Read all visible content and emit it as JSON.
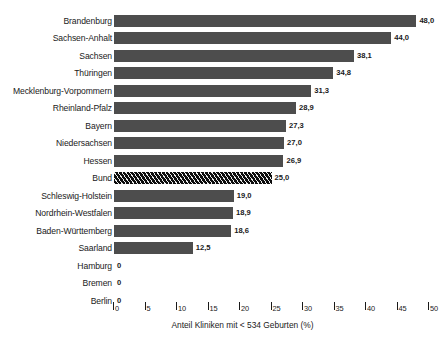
{
  "chart_data": {
    "type": "bar",
    "orientation": "horizontal",
    "title": "",
    "xlabel": "Anteil Kliniken mit < 534 Geburten (%)",
    "ylabel": "",
    "xlim": [
      0,
      50
    ],
    "xticks": [
      0,
      5,
      10,
      15,
      20,
      25,
      30,
      35,
      40,
      45,
      50
    ],
    "xtick_labels": [
      "0",
      "5",
      "10",
      "15",
      "20",
      "25",
      "30",
      "35",
      "40",
      "45",
      "50"
    ],
    "grid": false,
    "legend": "none",
    "decimal_separator": ",",
    "categories": [
      "Brandenburg",
      "Sachsen-Anhalt",
      "Sachsen",
      "Thüringen",
      "Mecklenburg-Vorpommern",
      "Rheinland-Pfalz",
      "Bayern",
      "Niedersachsen",
      "Hessen",
      "Bund",
      "Schleswig-Holstein",
      "Nordrhein-Westfalen",
      "Baden-Württemberg",
      "Saarland",
      "Hamburg",
      "Bremen",
      "Berlin"
    ],
    "values": [
      48.0,
      44.0,
      38.1,
      34.8,
      31.3,
      28.9,
      27.3,
      27.0,
      26.9,
      25.0,
      19.0,
      18.9,
      18.6,
      12.5,
      0,
      0,
      0
    ],
    "value_labels": [
      "48,0",
      "44,0",
      "38,1",
      "34,8",
      "31,3",
      "28,9",
      "27,3",
      "27,0",
      "26,9",
      "25,0",
      "19,0",
      "18,9",
      "18,6",
      "12,5",
      "0",
      "0",
      "0"
    ],
    "highlight_category": "Bund",
    "colors": {
      "bar": "#4d4d4d",
      "highlight_bar": "#0d0d0d",
      "background": "#ffffff",
      "text": "#1a1a1a"
    }
  },
  "caption": ""
}
